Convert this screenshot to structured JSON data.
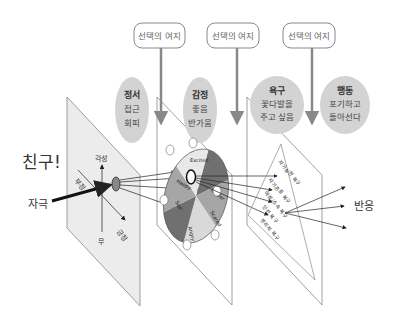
{
  "choice_boxes": [
    {
      "label": "선택의 여지"
    },
    {
      "label": "선택의 여지"
    },
    {
      "label": "선택의 여지"
    }
  ],
  "bubbles": [
    {
      "title": "정서",
      "lines": [
        "접근",
        "회피"
      ]
    },
    {
      "title": "감정",
      "lines": [
        "좋음",
        "반가움"
      ]
    },
    {
      "title": "욕구",
      "lines": [
        "꽃다발을",
        "주고 싶음"
      ]
    },
    {
      "title": "행동",
      "lines": [
        "포기하고",
        "돌아선다"
      ]
    }
  ],
  "left_labels": {
    "friend": "친구!",
    "stimulus": "자극"
  },
  "affect_plane": {
    "axis_top": "각성",
    "axis_bottom": "무",
    "axis_neg": "부정",
    "axis_pos": "긍정"
  },
  "emotion_wheel": {
    "segments": [
      "Excited",
      "Happy",
      "Sad",
      "Angry",
      "Scared",
      "Tender"
    ],
    "colors": {
      "light": "#d9d9d9",
      "mid": "#a6a6a6",
      "dark": "#707070"
    }
  },
  "needs_pyramid": {
    "levels": [
      "자기실현 욕구",
      "자기존중 욕구",
      "애정/소속 욕구",
      "안전 욕구",
      "생리적 욕구"
    ]
  },
  "output_label": "반응"
}
